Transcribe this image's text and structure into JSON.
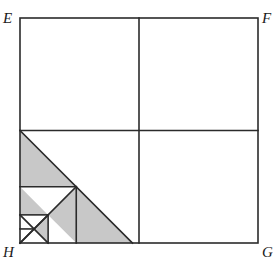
{
  "figure": {
    "square": {
      "left": 20,
      "top": 18,
      "right": 258,
      "bottom": 243,
      "width": 238,
      "height": 225
    },
    "center": {
      "x": 139,
      "y": 130.5
    },
    "colors": {
      "stroke": "#2b2b2b",
      "shade": "#c8c8c8",
      "background": "#ffffff",
      "label": "#1a1a1a"
    },
    "stroke_width": 1.6,
    "labels": [
      {
        "id": "E",
        "text": "E",
        "corner": "top-left"
      },
      {
        "id": "F",
        "text": "F",
        "corner": "top-right"
      },
      {
        "id": "G",
        "text": "G",
        "corner": "bottom-right"
      },
      {
        "id": "H",
        "text": "H",
        "corner": "bottom-left"
      }
    ],
    "grid_lines": [
      {
        "name": "vertical-midline",
        "x1": 139,
        "y1": 18,
        "x2": 139,
        "y2": 243
      },
      {
        "name": "horizontal-midline",
        "x1": 20,
        "y1": 130.5,
        "x2": 258,
        "y2": 130.5
      }
    ],
    "levels": [
      {
        "level": 1,
        "square": {
          "x": 20,
          "y": 130.5,
          "size": 112.5
        },
        "hypotenuse": {
          "x1": 20,
          "y1": 130.5,
          "x2": 132.5,
          "y2": 243
        },
        "shaded_triangle": {
          "points": "20,130.5 132.5,243 20,243"
        },
        "sub_square_line_h": {
          "x1": 20,
          "y1": 186.75,
          "x2": 76.25,
          "y2": 186.75
        },
        "sub_square_line_v": {
          "x1": 76.25,
          "y1": 186.75,
          "x2": 76.25,
          "y2": 243
        }
      },
      {
        "level": 2,
        "square": {
          "x": 20,
          "y": 186.75,
          "size": 56.25
        },
        "hypotenuse": {
          "x1": 20,
          "y1": 186.75,
          "x2": 76.25,
          "y2": 243
        },
        "anti_diagonal": {
          "x1": 76.25,
          "y1": 186.75,
          "x2": 20,
          "y2": 243
        },
        "shaded_triangle": {
          "points": "20,186.75 48.125,214.875 20,243"
        },
        "sub_square_line_h": {
          "x1": 20,
          "y1": 214.875,
          "x2": 48.125,
          "y2": 214.875
        },
        "sub_square_line_v": {
          "x1": 48.125,
          "y1": 214.875,
          "x2": 48.125,
          "y2": 243
        }
      },
      {
        "level": 3,
        "square": {
          "x": 20,
          "y": 214.875,
          "size": 28.125
        },
        "hypotenuse": {
          "x1": 20,
          "y1": 214.875,
          "x2": 48.125,
          "y2": 243
        },
        "anti_diagonal": {
          "x1": 48.125,
          "y1": 214.875,
          "x2": 20,
          "y2": 243
        },
        "shaded_triangle": {
          "points": "48.125,214.875 48.125,243 34.06,228.94"
        }
      },
      {
        "level": "mid-fill",
        "shaded_triangle_a": {
          "points": "76.25,186.75 76.25,243 48.125,214.875"
        },
        "shaded_triangle_b": {
          "points": "132.5,243 76.25,186.75 76.25,243"
        }
      }
    ]
  }
}
